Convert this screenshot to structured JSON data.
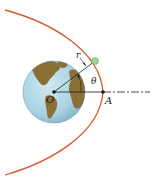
{
  "diagram": {
    "labels": {
      "origin": "O",
      "point_a": "A",
      "radius": "r",
      "angle": "θ"
    },
    "colors": {
      "orbit": "#d9572b",
      "ocean": "#a9d3e3",
      "land": "#8a6f36",
      "satellite": "#9fd49a",
      "line": "#1a1a1a"
    }
  }
}
